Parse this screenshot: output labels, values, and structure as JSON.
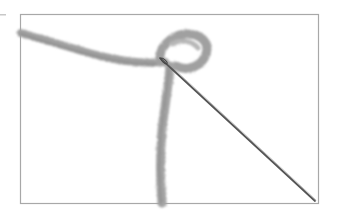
{
  "image": {
    "description": "Photograph of a strand of gray yarn forming a loop with a sewing needle threaded through it, inside a thin gray rectangular frame",
    "subjects": [
      "yarn",
      "needle",
      "frame"
    ],
    "colors": {
      "background": "#ffffff",
      "frame": "#a8a8a8",
      "yarn": "#9a9a9a",
      "yarn_shadow": "#7c7c7c",
      "needle": "#4a4a4a"
    }
  }
}
